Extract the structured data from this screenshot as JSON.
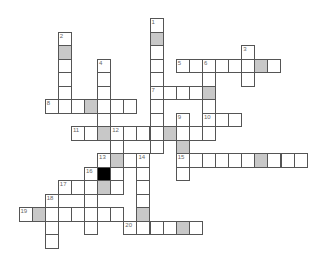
{
  "puzzle": {
    "type": "crossword",
    "layout": {
      "x0": 18.5,
      "y0": 18,
      "cell_w": 13.1,
      "cell_h": 13.5
    },
    "colors": {
      "border": "#555555",
      "shaded": "#c8c8c8",
      "block": "#000000",
      "number": "#666666"
    },
    "entries": [
      {
        "number": "1",
        "dir": "down",
        "row": 0,
        "col": 10,
        "len": 10,
        "shaded": [
          1
        ]
      },
      {
        "number": "2",
        "dir": "down",
        "row": 1,
        "col": 3,
        "len": 6,
        "shaded": [
          1
        ]
      },
      {
        "number": "3",
        "dir": "down",
        "row": 2,
        "col": 17,
        "len": 3,
        "shaded": []
      },
      {
        "number": "4",
        "dir": "down",
        "row": 3,
        "col": 6,
        "len": 6,
        "shaded": [
          5
        ]
      },
      {
        "number": "5",
        "dir": "across",
        "row": 3,
        "col": 12,
        "len": 8,
        "shaded": [
          6
        ]
      },
      {
        "number": "6",
        "dir": "down",
        "row": 3,
        "col": 14,
        "len": 6,
        "shaded": [
          2
        ]
      },
      {
        "number": "7",
        "dir": "across",
        "row": 5,
        "col": 10,
        "len": 5,
        "shaded": [
          4
        ]
      },
      {
        "number": "8",
        "dir": "across",
        "row": 6,
        "col": 2,
        "len": 7,
        "shaded": [
          3
        ]
      },
      {
        "number": "9",
        "dir": "down",
        "row": 7,
        "col": 12,
        "len": 5,
        "shaded": [
          2
        ]
      },
      {
        "number": "10",
        "dir": "across",
        "row": 7,
        "col": 14,
        "len": 3,
        "shaded": []
      },
      {
        "number": "11",
        "dir": "across",
        "row": 8,
        "col": 4,
        "len": 11,
        "shaded": [
          2,
          7
        ]
      },
      {
        "number": "12",
        "dir": "down",
        "row": 8,
        "col": 7,
        "len": 5,
        "shaded": [
          2
        ]
      },
      {
        "number": "13",
        "dir": "across",
        "row": 10,
        "col": 6,
        "len": 4,
        "shaded": [
          1
        ]
      },
      {
        "number": "14",
        "dir": "down",
        "row": 10,
        "col": 9,
        "len": 6,
        "shaded": [
          4
        ]
      },
      {
        "number": "15",
        "dir": "across",
        "row": 10,
        "col": 12,
        "len": 10,
        "shaded": [
          6
        ]
      },
      {
        "number": "16",
        "dir": "down",
        "row": 11,
        "col": 5,
        "len": 5,
        "shaded": []
      },
      {
        "number": "17",
        "dir": "across",
        "row": 12,
        "col": 3,
        "len": 5,
        "shaded": [
          3
        ]
      },
      {
        "number": "18",
        "dir": "down",
        "row": 13,
        "col": 2,
        "len": 4,
        "shaded": []
      },
      {
        "number": "19",
        "dir": "across",
        "row": 14,
        "col": 0,
        "len": 8,
        "shaded": [
          1
        ]
      },
      {
        "number": "20",
        "dir": "across",
        "row": 15,
        "col": 8,
        "len": 6,
        "shaded": [
          4
        ]
      }
    ],
    "blocks": [
      {
        "row": 11,
        "col": 6
      }
    ]
  }
}
